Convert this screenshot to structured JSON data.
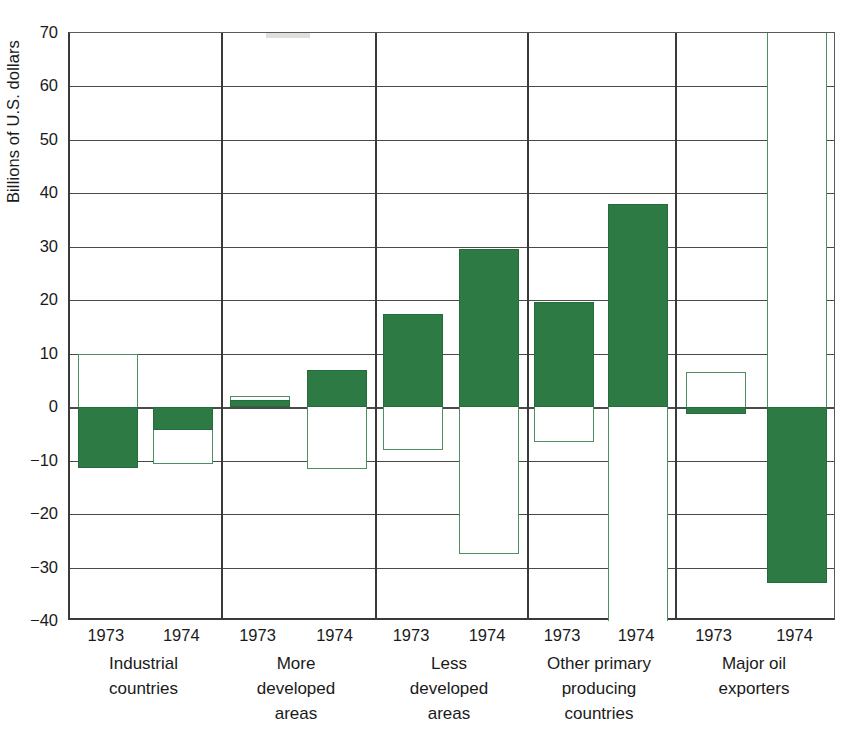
{
  "chart_data": {
    "type": "bar",
    "title": "",
    "subtitle": "",
    "xlabel": "",
    "ylabel": "Billions of U.S. dollars",
    "ylim": [
      -40,
      70
    ],
    "ytick_interval": 10,
    "yticks": [
      70,
      60,
      50,
      40,
      30,
      20,
      10,
      0,
      -10,
      -20,
      -30,
      -40
    ],
    "ytick_labels": [
      "70",
      "60",
      "50",
      "40",
      "30",
      "20",
      "10",
      "0",
      "−10",
      "−20",
      "−30",
      "−40"
    ],
    "grid": true,
    "legend": null,
    "legend_position": "none",
    "categories": [
      "1973",
      "1974",
      "1973",
      "1974",
      "1973",
      "1974",
      "1973",
      "1974",
      "1973",
      "1974"
    ],
    "groups": [
      {
        "name": "Industrial countries",
        "label_lines": [
          "Industrial",
          "countries"
        ],
        "bars": [
          {
            "year": "1973",
            "series": [
              {
                "name": "open",
                "style": "open",
                "value": 10.0
              },
              {
                "name": "filled",
                "style": "filled",
                "value": -11.3
              }
            ]
          },
          {
            "year": "1974",
            "series": [
              {
                "name": "filled",
                "style": "filled",
                "value": -4.3
              },
              {
                "name": "open",
                "style": "open",
                "value": -10.6
              }
            ]
          }
        ]
      },
      {
        "name": "More developed areas",
        "label_lines": [
          "More",
          "developed",
          "areas"
        ],
        "bars": [
          {
            "year": "1973",
            "series": [
              {
                "name": "open",
                "style": "open",
                "value": 2.0
              },
              {
                "name": "filled",
                "style": "filled",
                "value": 1.4
              }
            ]
          },
          {
            "year": "1974",
            "series": [
              {
                "name": "filled",
                "style": "filled",
                "value": 7.0
              },
              {
                "name": "open",
                "style": "open",
                "value": -11.5
              }
            ]
          }
        ]
      },
      {
        "name": "Less developed areas",
        "label_lines": [
          "Less",
          "developed",
          "areas"
        ],
        "bars": [
          {
            "year": "1973",
            "series": [
              {
                "name": "filled",
                "style": "filled",
                "value": 17.5
              },
              {
                "name": "open",
                "style": "open",
                "value": -8.0
              }
            ]
          },
          {
            "year": "1974",
            "series": [
              {
                "name": "filled",
                "style": "filled",
                "value": 29.5
              },
              {
                "name": "open",
                "style": "open",
                "value": -27.5
              }
            ]
          }
        ]
      },
      {
        "name": "Other primary producing countries",
        "label_lines": [
          "Other primary",
          "producing",
          "countries"
        ],
        "bars": [
          {
            "year": "1973",
            "series": [
              {
                "name": "filled",
                "style": "filled",
                "value": 19.6
              },
              {
                "name": "open",
                "style": "open",
                "value": -6.6
              }
            ]
          },
          {
            "year": "1974",
            "series": [
              {
                "name": "filled",
                "style": "filled",
                "value": 38.0
              },
              {
                "name": "open",
                "style": "open",
                "value": -42.0,
                "clipped": true
              }
            ]
          }
        ]
      },
      {
        "name": "Major oil exporters",
        "label_lines": [
          "Major oil",
          "exporters"
        ],
        "bars": [
          {
            "year": "1973",
            "series": [
              {
                "name": "open",
                "style": "open",
                "value": 6.6
              },
              {
                "name": "filled",
                "style": "filled",
                "value": -1.2
              }
            ]
          },
          {
            "year": "1974",
            "series": [
              {
                "name": "open",
                "style": "open",
                "value": 72.0,
                "clipped": true
              },
              {
                "name": "filled",
                "style": "filled",
                "value": -32.8
              }
            ]
          }
        ]
      }
    ]
  },
  "colors": {
    "filled": "#2d7a45",
    "open_outline": "#4d8f63",
    "background": "#ffffff",
    "axis": "#3a3a38",
    "gridline": "#4a4a46",
    "text": "#1a1a1a"
  }
}
